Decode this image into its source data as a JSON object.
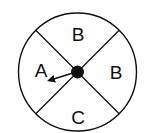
{
  "diagram": {
    "type": "spinner",
    "sections": [
      {
        "position": "top",
        "label": "B"
      },
      {
        "position": "right",
        "label": "B"
      },
      {
        "position": "bottom",
        "label": "C"
      },
      {
        "position": "left",
        "label": "A"
      }
    ],
    "pointer": {
      "points_to": "A"
    },
    "colors": {
      "stroke": "#111111",
      "background": "#ffffff"
    }
  }
}
